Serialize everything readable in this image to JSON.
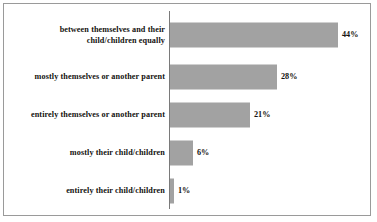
{
  "chart_data": {
    "type": "bar",
    "orientation": "horizontal",
    "title": "",
    "subtitle": "",
    "xlabel": "",
    "ylabel": "",
    "grid": false,
    "legend": null,
    "xlim": [
      0,
      48
    ],
    "categories": [
      "between themselves and their child/children equally",
      "mostly themselves or another parent",
      "entirely themselves or another parent",
      "mostly their child/children",
      "entirely their child/children"
    ],
    "values": [
      44,
      28,
      21,
      6,
      1
    ],
    "value_labels": [
      "44%",
      "28%",
      "21%",
      "6%",
      "1%"
    ],
    "bar_color": "#a2a2a2",
    "frame_color": "#9a9a9a",
    "text_color": "#14120f"
  },
  "rows": [
    {
      "label_line1": "between themselves and their",
      "label_line2": "child/children equally",
      "value_label": "44%",
      "bar_px": 168
    },
    {
      "label_line1": "mostly themselves or another parent",
      "label_line2": "",
      "value_label": "28%",
      "bar_px": 107
    },
    {
      "label_line1": "entirely themselves or another parent",
      "label_line2": "",
      "value_label": "21%",
      "bar_px": 80
    },
    {
      "label_line1": "mostly their child/children",
      "label_line2": "",
      "value_label": "6%",
      "bar_px": 23
    },
    {
      "label_line1": "entirely their child/children",
      "label_line2": "",
      "value_label": "1%",
      "bar_px": 4
    }
  ]
}
